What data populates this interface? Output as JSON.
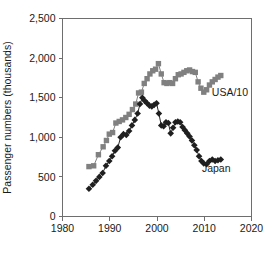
{
  "chart_data": {
    "type": "line",
    "title": "",
    "subtitle": "",
    "xlabel": "",
    "ylabel": "Passenger numbers (thousands)",
    "xlim": [
      1980,
      2020
    ],
    "ylim": [
      0,
      2500
    ],
    "xticks": [
      1980,
      1990,
      2000,
      2010,
      2020
    ],
    "yticks": [
      0,
      500,
      1000,
      1500,
      2000,
      2500
    ],
    "xticklabels": [
      "1980",
      "1990",
      "2000",
      "2010",
      "2020"
    ],
    "yticklabels": [
      "0",
      "500",
      "1,000",
      "1,500",
      "2,000",
      "2,500"
    ],
    "grid": false,
    "legend_position": "inline-annotation",
    "series": [
      {
        "name": "USA/10",
        "marker": "square",
        "color": "#808080",
        "label_annotation": "USA/10",
        "label_x": 2011.6,
        "label_y": 1520,
        "x": [
          1985.6,
          1986.6,
          1987.6,
          1988.6,
          1989.3,
          1989.9,
          1990.6,
          1991.3,
          1992.0,
          1992.7,
          1993.4,
          1994.1,
          1994.8,
          1995.5,
          1996.1,
          1996.7,
          1997.3,
          1997.9,
          1998.5,
          1999.1,
          1999.7,
          2000.3,
          2000.9,
          2001.5,
          2002.1,
          2002.7,
          2003.3,
          2003.9,
          2004.5,
          2005.1,
          2005.7,
          2006.3,
          2006.9,
          2007.5,
          2008.1,
          2008.7,
          2009.3,
          2009.9,
          2010.5,
          2011.1,
          2011.7,
          2012.3,
          2012.9,
          2013.5
        ],
        "y": [
          630,
          640,
          780,
          880,
          960,
          1040,
          1060,
          1180,
          1200,
          1220,
          1250,
          1290,
          1350,
          1420,
          1560,
          1570,
          1680,
          1740,
          1800,
          1840,
          1860,
          1930,
          1800,
          1690,
          1680,
          1690,
          1680,
          1740,
          1790,
          1800,
          1820,
          1840,
          1850,
          1830,
          1820,
          1700,
          1620,
          1570,
          1600,
          1660,
          1700,
          1730,
          1760,
          1780
        ]
      },
      {
        "name": "Japan",
        "marker": "diamond",
        "color": "#1f1f1f",
        "label_annotation": "Japan",
        "label_x": 2009.5,
        "label_y": 560,
        "x": [
          1985.6,
          1986.4,
          1987.1,
          1987.8,
          1988.5,
          1989.2,
          1989.9,
          1990.5,
          1991.1,
          1991.7,
          1992.3,
          1992.9,
          1993.5,
          1994.1,
          1994.7,
          1995.3,
          1995.9,
          1996.4,
          1996.9,
          1997.4,
          1997.9,
          1998.4,
          1998.9,
          1999.4,
          1999.9,
          2000.4,
          2000.9,
          2001.4,
          2001.9,
          2002.4,
          2002.9,
          2003.4,
          2003.9,
          2004.4,
          2004.9,
          2005.4,
          2005.9,
          2006.4,
          2006.9,
          2007.4,
          2007.9,
          2008.4,
          2008.9,
          2009.4,
          2009.9,
          2010.5,
          2011.1,
          2011.7,
          2012.3,
          2012.9,
          2013.5
        ],
        "y": [
          350,
          400,
          450,
          500,
          550,
          640,
          700,
          760,
          830,
          870,
          1000,
          1040,
          1030,
          1080,
          1150,
          1220,
          1300,
          1420,
          1500,
          1460,
          1430,
          1400,
          1390,
          1410,
          1430,
          1300,
          1150,
          1140,
          1190,
          1180,
          1050,
          1120,
          1190,
          1200,
          1190,
          1130,
          1090,
          1050,
          1010,
          960,
          900,
          840,
          760,
          700,
          670,
          660,
          700,
          720,
          700,
          710,
          720
        ]
      }
    ]
  },
  "axes": {
    "y_axis_title": "Passenger numbers (thousands)"
  }
}
